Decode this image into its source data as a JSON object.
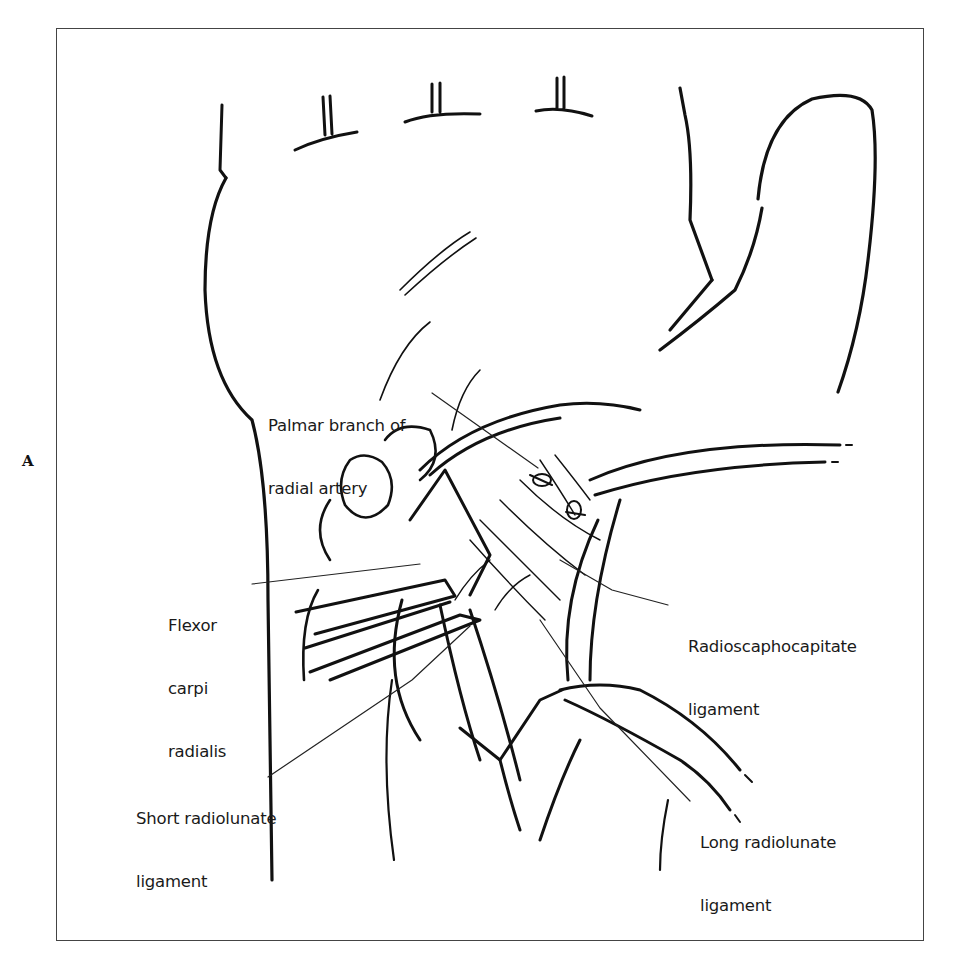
{
  "figure": {
    "panel_letter": "A",
    "labels": [
      {
        "id": "palmar-branch-radial-artery",
        "lines": [
          "Palmar branch of",
          "radial artery"
        ]
      },
      {
        "id": "flexor-carpi-radialis",
        "lines": [
          "Flexor",
          "carpi",
          "radialis"
        ]
      },
      {
        "id": "radioscaphocapitate-ligament",
        "lines": [
          "Radioscaphocapitate",
          "ligament"
        ]
      },
      {
        "id": "short-radiolunate-ligament",
        "lines": [
          "Short radiolunate",
          "ligament"
        ]
      },
      {
        "id": "long-radiolunate-ligament",
        "lines": [
          "Long radiolunate",
          "ligament"
        ]
      }
    ]
  },
  "colors": {
    "line_art": "#111111",
    "frame": "#444444",
    "text": "#1a1a1a",
    "background": "#ffffff"
  }
}
